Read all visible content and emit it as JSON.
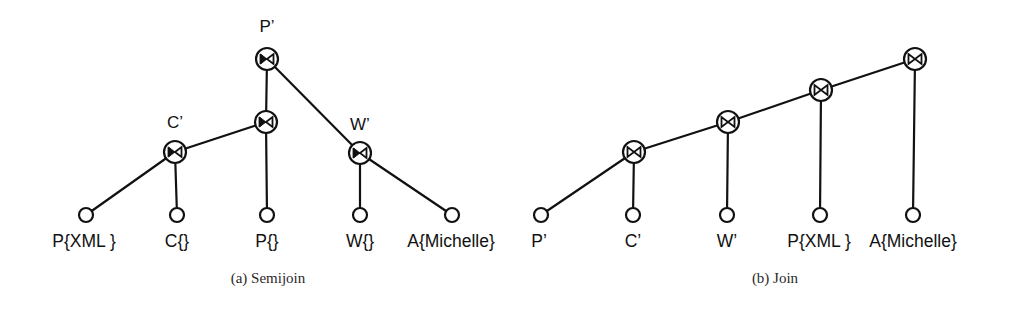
{
  "figure": {
    "background_color": "#ffffff",
    "ink_color": "#111111",
    "panels": [
      {
        "id": "semijoin",
        "caption": "(a) Semijoin",
        "caption_x": 268,
        "caption_y": 283,
        "operator_symbol": "⋉",
        "operator_name": "semijoin-bowtie-icon",
        "internal_nodes": [
          {
            "name": "node-p-prime",
            "label": "P’",
            "x": 267,
            "y": 59,
            "label_x": 267,
            "label_y": 32
          },
          {
            "name": "node-unlabeled-mid",
            "label": "",
            "x": 266,
            "y": 122,
            "label_x": 266,
            "label_y": 96
          },
          {
            "name": "node-c-prime",
            "label": "C’",
            "x": 175,
            "y": 152,
            "label_x": 175,
            "label_y": 128
          },
          {
            "name": "node-w-prime",
            "label": "W’",
            "x": 360,
            "y": 153,
            "label_x": 360,
            "label_y": 130
          }
        ],
        "leaves": [
          {
            "name": "leaf-p-xml",
            "label": "P{XML }",
            "x": 86,
            "y": 215,
            "label_x": 84,
            "label_y": 247
          },
          {
            "name": "leaf-c-empty",
            "label": "C{}",
            "x": 177,
            "y": 215,
            "label_x": 177,
            "label_y": 247
          },
          {
            "name": "leaf-p-empty",
            "label": "P{}",
            "x": 267,
            "y": 215,
            "label_x": 267,
            "label_y": 247
          },
          {
            "name": "leaf-w-empty",
            "label": "W{}",
            "x": 360,
            "y": 215,
            "label_x": 360,
            "label_y": 247
          },
          {
            "name": "leaf-a-michelle",
            "label": "A{Michelle}",
            "x": 452,
            "y": 215,
            "label_x": 451,
            "label_y": 247
          }
        ],
        "edges": [
          {
            "name": "edge-pprime-to-mid",
            "from": [
              267,
              59
            ],
            "to": [
              266,
              122
            ]
          },
          {
            "name": "edge-pprime-to-wprime",
            "from": [
              267,
              59
            ],
            "to": [
              360,
              153
            ]
          },
          {
            "name": "edge-mid-to-cprime",
            "from": [
              266,
              122
            ],
            "to": [
              175,
              152
            ]
          },
          {
            "name": "edge-mid-to-p-empty",
            "from": [
              266,
              122
            ],
            "to": [
              267,
              215
            ]
          },
          {
            "name": "edge-cprime-to-p-xml",
            "from": [
              175,
              152
            ],
            "to": [
              86,
              215
            ]
          },
          {
            "name": "edge-cprime-to-c-empty",
            "from": [
              175,
              152
            ],
            "to": [
              177,
              215
            ]
          },
          {
            "name": "edge-wprime-to-w-empty",
            "from": [
              360,
              153
            ],
            "to": [
              360,
              215
            ]
          },
          {
            "name": "edge-wprime-to-a-michelle",
            "from": [
              360,
              153
            ],
            "to": [
              452,
              215
            ]
          }
        ]
      },
      {
        "id": "join",
        "caption": "(b) Join",
        "caption_x": 775,
        "caption_y": 283,
        "operator_symbol": "⋈",
        "operator_name": "join-bowtie-icon",
        "internal_nodes": [
          {
            "name": "node-join-top",
            "label": "",
            "x": 915,
            "y": 59,
            "label_x": 915,
            "label_y": 32
          },
          {
            "name": "node-join-3",
            "label": "",
            "x": 821,
            "y": 90,
            "label_x": 821,
            "label_y": 64
          },
          {
            "name": "node-join-2",
            "label": "",
            "x": 728,
            "y": 122,
            "label_x": 728,
            "label_y": 96
          },
          {
            "name": "node-join-1",
            "label": "",
            "x": 634,
            "y": 152,
            "label_x": 634,
            "label_y": 128
          }
        ],
        "leaves": [
          {
            "name": "leaf-p-prime",
            "label": "P’",
            "x": 541,
            "y": 215,
            "label_x": 539,
            "label_y": 247
          },
          {
            "name": "leaf-c-prime",
            "label": "C’",
            "x": 633,
            "y": 215,
            "label_x": 633,
            "label_y": 247
          },
          {
            "name": "leaf-w-prime",
            "label": "W’",
            "x": 727,
            "y": 215,
            "label_x": 727,
            "label_y": 247
          },
          {
            "name": "leaf-p-xml-b",
            "label": "P{XML }",
            "x": 820,
            "y": 215,
            "label_x": 819,
            "label_y": 247
          },
          {
            "name": "leaf-a-michelle-b",
            "label": "A{Michelle}",
            "x": 913,
            "y": 215,
            "label_x": 913,
            "label_y": 247
          }
        ],
        "edges": [
          {
            "name": "edge-join1-to-p-prime",
            "from": [
              634,
              152
            ],
            "to": [
              541,
              215
            ]
          },
          {
            "name": "edge-join1-to-c-prime",
            "from": [
              634,
              152
            ],
            "to": [
              633,
              215
            ]
          },
          {
            "name": "edge-join2-to-join1",
            "from": [
              728,
              122
            ],
            "to": [
              634,
              152
            ]
          },
          {
            "name": "edge-join2-to-w-prime",
            "from": [
              728,
              122
            ],
            "to": [
              727,
              215
            ]
          },
          {
            "name": "edge-join3-to-join2",
            "from": [
              821,
              90
            ],
            "to": [
              728,
              122
            ]
          },
          {
            "name": "edge-join3-to-p-xml",
            "from": [
              821,
              90
            ],
            "to": [
              820,
              215
            ]
          },
          {
            "name": "edge-jointop-to-join3",
            "from": [
              915,
              59
            ],
            "to": [
              821,
              90
            ]
          },
          {
            "name": "edge-jointop-to-a-michelle",
            "from": [
              915,
              59
            ],
            "to": [
              913,
              215
            ]
          }
        ]
      }
    ],
    "geometry": {
      "operator_radius": 11,
      "leaf_radius": 7
    }
  }
}
